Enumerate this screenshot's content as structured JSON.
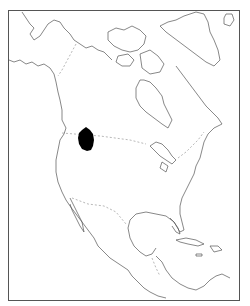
{
  "map": {
    "region": "North America",
    "type": "distribution map",
    "highlighted_area": {
      "description": "southern British Columbia / northern Washington-Idaho region",
      "fill": "#000000"
    },
    "colors": {
      "background": "#ffffff",
      "coastline": "#555555",
      "border": "#888888",
      "range": "#000000"
    }
  }
}
